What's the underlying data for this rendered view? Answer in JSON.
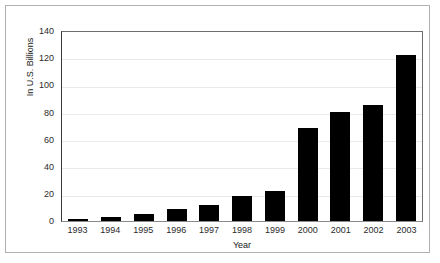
{
  "chart_data": {
    "type": "bar",
    "title": "",
    "xlabel": "Year",
    "ylabel": "In U.S. Billions",
    "categories": [
      "1993",
      "1994",
      "1995",
      "1996",
      "1997",
      "1998",
      "1999",
      "2000",
      "2001",
      "2002",
      "2003"
    ],
    "values": [
      1,
      3,
      5,
      9,
      12,
      18,
      22,
      68,
      80,
      85,
      122
    ],
    "ylim": [
      0,
      140
    ],
    "ytick_labels": [
      "140",
      "120",
      "100",
      "80",
      "60",
      "40",
      "20",
      "0"
    ],
    "ytick_values": [
      140,
      120,
      100,
      80,
      60,
      40,
      20,
      0
    ],
    "ytick_step": 20,
    "grid": true,
    "legend": false,
    "bar_color": "#000000",
    "gridline_color": "#e9e9e9",
    "axis_color": "#3a3a3a",
    "frame_color": "#b0b0b0",
    "background_color": "#ffffff"
  }
}
